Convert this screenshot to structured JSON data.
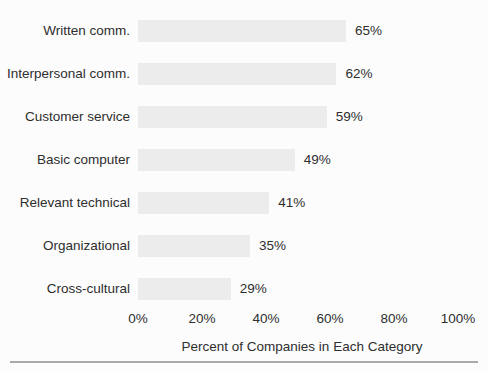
{
  "chart_data": {
    "type": "bar",
    "orientation": "horizontal",
    "categories": [
      "Written comm.",
      "Interpersonal comm.",
      "Customer service",
      "Basic computer",
      "Relevant technical",
      "Organizational",
      "Cross-cultural"
    ],
    "values": [
      65,
      62,
      59,
      49,
      41,
      35,
      29
    ],
    "value_labels": [
      "65%",
      "62%",
      "59%",
      "49%",
      "41%",
      "35%",
      "29%"
    ],
    "x_ticks": [
      "0%",
      "20%",
      "40%",
      "60%",
      "80%",
      "100%"
    ],
    "xlim": [
      0,
      100
    ],
    "xlabel": "Percent of Companies in Each Category",
    "grid": false,
    "legend": "none",
    "colors": {
      "bar": "#ececec",
      "text": "#2e2e2e",
      "rule": "#a9a9a9",
      "background": "#fcfcfc"
    }
  }
}
